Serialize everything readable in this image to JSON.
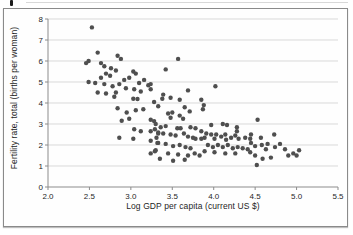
{
  "figure": {
    "background": "#fefefe",
    "border_color": "#8a8a8a"
  },
  "chart_data": {
    "type": "scatter",
    "title": "",
    "xlabel": "Log GDP per capita (current US $)",
    "ylabel": "Fertility rate, total (births per woman)",
    "xlim": [
      2.0,
      5.5
    ],
    "ylim": [
      0,
      8
    ],
    "xticks": [
      2.0,
      2.5,
      3.0,
      3.5,
      4.0,
      4.5,
      5.0,
      5.5
    ],
    "xtick_labels": [
      "2.0",
      "2.5",
      "3.0",
      "3.5",
      "4.0",
      "4.5",
      "5.0",
      "5.5"
    ],
    "yticks": [
      0,
      1,
      2,
      3,
      4,
      5,
      6,
      7,
      8
    ],
    "ytick_labels": [
      "0",
      "1",
      "2",
      "3",
      "4",
      "5",
      "6",
      "7",
      "8"
    ],
    "grid": "horizontal",
    "legend": "none",
    "gridline_color": "#d9d9d9",
    "axis_color": "#8c8c8c",
    "tick_label_color": "#262626",
    "marker": {
      "shape": "circle",
      "color": "#4f4f4f",
      "radius": 2.2
    },
    "points": [
      [
        2.53,
        7.6
      ],
      [
        2.46,
        5.9
      ],
      [
        2.49,
        6.0
      ],
      [
        2.6,
        6.4
      ],
      [
        2.64,
        5.9
      ],
      [
        2.68,
        5.75
      ],
      [
        2.84,
        6.25
      ],
      [
        2.88,
        6.1
      ],
      [
        2.76,
        5.65
      ],
      [
        2.82,
        5.55
      ],
      [
        2.7,
        5.4
      ],
      [
        2.75,
        5.3
      ],
      [
        2.64,
        5.2
      ],
      [
        2.49,
        5.0
      ],
      [
        2.57,
        4.95
      ],
      [
        2.68,
        4.9
      ],
      [
        2.78,
        4.8
      ],
      [
        2.86,
        4.9
      ],
      [
        2.92,
        5.1
      ],
      [
        3.03,
        5.5
      ],
      [
        3.06,
        5.4
      ],
      [
        2.98,
        5.2
      ],
      [
        3.1,
        4.95
      ],
      [
        3.16,
        5.1
      ],
      [
        3.21,
        4.85
      ],
      [
        2.94,
        4.7
      ],
      [
        3.04,
        4.65
      ],
      [
        3.12,
        4.55
      ],
      [
        2.82,
        4.5
      ],
      [
        2.7,
        4.45
      ],
      [
        2.6,
        4.5
      ],
      [
        3.57,
        6.1
      ],
      [
        3.42,
        5.6
      ],
      [
        3.24,
        4.9
      ],
      [
        3.24,
        4.65
      ],
      [
        3.69,
        4.6
      ],
      [
        4.02,
        4.8
      ],
      [
        3.39,
        4.4
      ],
      [
        2.8,
        4.3
      ],
      [
        3.03,
        4.2
      ],
      [
        3.08,
        4.19
      ],
      [
        3.28,
        4.05
      ],
      [
        2.84,
        3.75
      ],
      [
        2.95,
        3.55
      ],
      [
        3.06,
        3.65
      ],
      [
        3.15,
        3.7
      ],
      [
        2.89,
        3.15
      ],
      [
        2.98,
        3.25
      ],
      [
        3.28,
        3.14
      ],
      [
        3.04,
        2.75
      ],
      [
        3.12,
        2.65
      ],
      [
        3.29,
        2.75
      ],
      [
        3.33,
        2.55
      ],
      [
        2.86,
        2.35
      ],
      [
        3.03,
        2.3
      ],
      [
        3.31,
        2.35
      ],
      [
        3.33,
        2.1
      ],
      [
        3.24,
        1.6
      ],
      [
        3.3,
        1.75
      ],
      [
        3.38,
        4.2
      ],
      [
        3.48,
        4.25
      ],
      [
        3.59,
        4.15
      ],
      [
        3.33,
        3.85
      ],
      [
        3.65,
        3.8
      ],
      [
        3.71,
        3.6
      ],
      [
        3.45,
        3.5
      ],
      [
        3.5,
        3.55
      ],
      [
        3.48,
        3.3
      ],
      [
        3.59,
        3.4
      ],
      [
        3.63,
        3.25
      ],
      [
        3.24,
        3.2
      ],
      [
        3.3,
        3.0
      ],
      [
        3.36,
        2.85
      ],
      [
        3.42,
        2.9
      ],
      [
        3.56,
        2.8
      ],
      [
        3.6,
        2.8
      ],
      [
        3.72,
        2.85
      ],
      [
        3.78,
        2.8
      ],
      [
        3.24,
        2.65
      ],
      [
        3.33,
        2.6
      ],
      [
        3.39,
        2.55
      ],
      [
        3.48,
        2.5
      ],
      [
        3.54,
        2.45
      ],
      [
        3.64,
        2.55
      ],
      [
        3.69,
        2.4
      ],
      [
        3.75,
        2.35
      ],
      [
        3.78,
        2.3
      ],
      [
        3.24,
        2.2
      ],
      [
        3.32,
        2.1
      ],
      [
        3.42,
        2.05
      ],
      [
        3.51,
        1.95
      ],
      [
        3.59,
        2.0
      ],
      [
        3.66,
        1.9
      ],
      [
        3.72,
        1.85
      ],
      [
        3.29,
        1.7
      ],
      [
        3.45,
        1.6
      ],
      [
        3.57,
        1.55
      ],
      [
        3.69,
        1.5
      ],
      [
        3.77,
        1.6
      ],
      [
        3.35,
        1.35
      ],
      [
        3.51,
        1.25
      ],
      [
        3.65,
        1.3
      ],
      [
        3.85,
        4.15
      ],
      [
        3.88,
        3.9
      ],
      [
        3.87,
        3.7
      ],
      [
        3.97,
        2.95
      ],
      [
        4.11,
        3.0
      ],
      [
        4.16,
        2.95
      ],
      [
        4.28,
        2.85
      ],
      [
        3.85,
        2.65
      ],
      [
        3.91,
        2.55
      ],
      [
        3.89,
        2.35
      ],
      [
        3.85,
        2.3
      ],
      [
        3.97,
        2.5
      ],
      [
        4.03,
        2.5
      ],
      [
        4.01,
        2.3
      ],
      [
        4.09,
        2.4
      ],
      [
        4.14,
        2.5
      ],
      [
        4.15,
        2.25
      ],
      [
        4.21,
        2.35
      ],
      [
        4.26,
        2.45
      ],
      [
        4.3,
        2.3
      ],
      [
        4.38,
        2.35
      ],
      [
        4.44,
        2.3
      ],
      [
        4.45,
        2.5
      ],
      [
        3.93,
        2.0
      ],
      [
        3.99,
        1.9
      ],
      [
        4.05,
        2.0
      ],
      [
        4.11,
        1.9
      ],
      [
        4.17,
        2.0
      ],
      [
        4.23,
        1.85
      ],
      [
        4.29,
        1.9
      ],
      [
        4.35,
        1.85
      ],
      [
        4.41,
        1.8
      ],
      [
        3.89,
        1.7
      ],
      [
        4.01,
        1.65
      ],
      [
        4.14,
        1.6
      ],
      [
        4.26,
        1.6
      ],
      [
        3.83,
        1.5
      ],
      [
        4.53,
        3.2
      ],
      [
        4.28,
        2.65
      ],
      [
        4.45,
        2.1
      ],
      [
        4.5,
        1.95
      ],
      [
        4.57,
        2.35
      ],
      [
        4.58,
        2.0
      ],
      [
        4.63,
        1.8
      ],
      [
        4.65,
        2.05
      ],
      [
        4.73,
        2.5
      ],
      [
        4.74,
        1.9
      ],
      [
        4.8,
        2.05
      ],
      [
        4.69,
        1.4
      ],
      [
        4.59,
        1.35
      ],
      [
        4.5,
        1.5
      ],
      [
        4.44,
        1.65
      ],
      [
        4.86,
        1.8
      ],
      [
        4.9,
        1.5
      ],
      [
        4.96,
        1.6
      ],
      [
        5.0,
        1.5
      ],
      [
        5.03,
        1.75
      ],
      [
        4.52,
        1.05
      ]
    ],
    "plot_area": {
      "left": 44,
      "top": 10,
      "width": 290,
      "height": 168
    }
  }
}
